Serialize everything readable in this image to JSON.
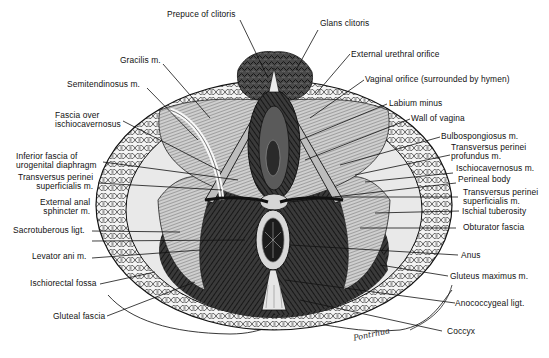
{
  "figure": {
    "signature": "Pontrhua"
  },
  "labels_top": [
    {
      "id": "prepuce",
      "text": "Prepuce of clitoris"
    },
    {
      "id": "glans",
      "text": "Glans clitoris"
    }
  ],
  "labels_left": [
    {
      "id": "gracilis",
      "text": "Gracilis m."
    },
    {
      "id": "semitendinosus",
      "text": "Semitendinosus m."
    },
    {
      "id": "fascia_ischio",
      "line1": "Fascia over",
      "line2": "ischiocavernosus"
    },
    {
      "id": "inf_fascia",
      "line1": "Inferior fascia of",
      "line2": "urogenital diaphragm"
    },
    {
      "id": "tps_left",
      "line1": "Transversus perinei",
      "line2": "superficialis m."
    },
    {
      "id": "ext_anal",
      "line1": "External anal",
      "line2": "sphincter m."
    },
    {
      "id": "sacrotuberous",
      "text": "Sacrotuberous ligt."
    },
    {
      "id": "levator",
      "text": "Levator ani m."
    },
    {
      "id": "ischiorectal",
      "text": "Ischiorectal fossa"
    },
    {
      "id": "gluteal_fascia",
      "text": "Gluteal fascia"
    }
  ],
  "labels_right": [
    {
      "id": "ext_urethral",
      "text": "External urethral orifice"
    },
    {
      "id": "vaginal_orifice",
      "text": "Vaginal orifice (surrounded by hymen)"
    },
    {
      "id": "labium_minus",
      "text": "Labium minus"
    },
    {
      "id": "wall_vagina",
      "text": "Wall of vagina"
    },
    {
      "id": "bulbospongiosus",
      "text": "Bulbospongiosus m."
    },
    {
      "id": "tpp",
      "line1": "Transversus perinei",
      "line2": "profundus m."
    },
    {
      "id": "ischiocavernosus",
      "text": "Ischiocavernosus m."
    },
    {
      "id": "perineal_body",
      "text": "Perineal body"
    },
    {
      "id": "tps_right",
      "line1": "Transversus perinei",
      "line2": "superficialis m."
    },
    {
      "id": "ischial_tuberosity",
      "text": "Ischial tuberosity"
    },
    {
      "id": "obturator",
      "text": "Obturator fascia"
    },
    {
      "id": "anus",
      "text": "Anus"
    },
    {
      "id": "gluteus_max",
      "text": "Gluteus maximus m."
    },
    {
      "id": "anococcygeal",
      "text": "Anococcygeal ligt."
    },
    {
      "id": "coccyx",
      "text": "Coccyx"
    }
  ]
}
